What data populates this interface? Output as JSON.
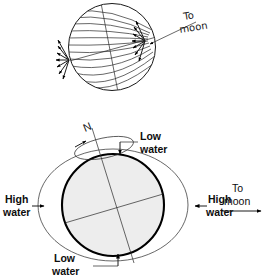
{
  "figure": {
    "background_color": "#ffffff",
    "ink_color": "#000000",
    "earth_fill_color": "#ededed",
    "width": 265,
    "height": 279
  },
  "top_panel": {
    "name": "tidal-force-sphere",
    "description": "Sphere with converging field lines and two clusters of force arrows pointing toward sublunar and antipodal points",
    "sphere": {
      "cx": 112,
      "cy": 47,
      "r": 44
    },
    "moon_arrow": {
      "label_line1": "To",
      "label_line2": "moon",
      "direction": "up-right",
      "tail": {
        "x": 150,
        "y": 44
      },
      "tip": {
        "x": 196,
        "y": 22
      }
    },
    "field_line_count": 11,
    "arrow_cluster_count": 2,
    "arrows_per_cluster": 7
  },
  "bottom_panel": {
    "name": "earth-tidal-bulge",
    "earth": {
      "cx": 113,
      "cy": 205,
      "r": 52
    },
    "bulge_ellipse": {
      "cx": 113,
      "cy": 205,
      "rx": 75,
      "ry": 56
    },
    "axis_label": "N",
    "rotation_arrow": "counterclockwise",
    "labels": {
      "north_pole": "N",
      "low_water_top_line1": "Low",
      "low_water_top_line2": "water",
      "low_water_bottom_line1": "Low",
      "low_water_bottom_line2": "water",
      "high_water_left_line1": "High",
      "high_water_left_line2": "water",
      "high_water_right_line1": "High",
      "high_water_right_line2": "water",
      "to_moon_line1": "To",
      "to_moon_line2": "moon"
    }
  }
}
